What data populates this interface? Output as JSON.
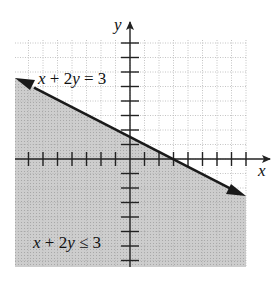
{
  "chart_data": {
    "type": "area",
    "title": "",
    "xlabel": "x",
    "ylabel": "y",
    "xlim": [
      -8,
      8
    ],
    "ylim": [
      -7.5,
      8
    ],
    "grid": true,
    "tick_spacing": 1,
    "boundary_line": {
      "equation": "x + 2y = 3",
      "slope": -0.5,
      "y_intercept": 1.5,
      "x_intercept": 3,
      "style": "solid",
      "arrows": "both"
    },
    "shaded_region": {
      "inequality": "x + 2y ≤ 3",
      "side": "below"
    },
    "annotations": [
      {
        "text": "x + 2y = 3",
        "position": "upper-left, above line"
      },
      {
        "text": "x + 2y ≤ 3",
        "position": "lower-left, in shaded region"
      }
    ]
  },
  "labels": {
    "x_axis": "x",
    "y_axis": "y",
    "line_label_lhs": "x + 2y = 3",
    "region_label": "x + 2y ≤ 3"
  },
  "colors": {
    "shade": "#c8c8c8",
    "grid": "#b0b0b0",
    "axis": "#222222",
    "line": "#1a1a1a"
  }
}
